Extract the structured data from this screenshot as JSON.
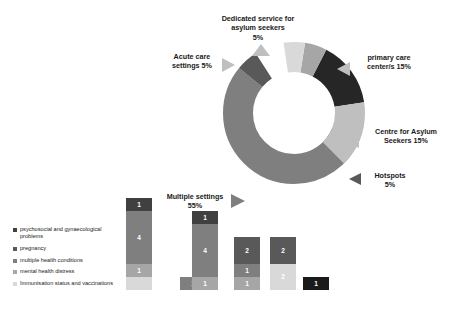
{
  "chart_data": [
    {
      "type": "pie",
      "title": "",
      "subtype": "donut",
      "legend_position": "callouts",
      "categories": [
        "Multiple settings",
        "primary care center/s",
        "Centre for Asylum Seekers",
        "Hotspots",
        "Dedicated service for asylum seekers",
        "Acute care settings"
      ],
      "values": [
        55,
        15,
        15,
        5,
        5,
        5
      ],
      "unit": "%",
      "labels": [
        {
          "name": "Dedicated service for asylum seekers",
          "value": "5%",
          "text": "Dedicated service for\nasylum seekers\n5%",
          "color": "#a6a6a6"
        },
        {
          "name": "Acute care settings",
          "value": "5%",
          "text": "Acute care\nsettings 5%",
          "color": "#d9d9d9"
        },
        {
          "name": "primary care center/s",
          "value": "15%",
          "text": "primary care\ncenter/s 15%",
          "color": "#262626"
        },
        {
          "name": "Centre for Asylum Seekers",
          "value": "15%",
          "text": "Centre for Asylum\nSeekers 15%",
          "color": "#bfbfbf"
        },
        {
          "name": "Hotspots",
          "value": "5%",
          "text": "Hotspots\n5%",
          "color": "#595959"
        },
        {
          "name": "Multiple settings",
          "value": "55%",
          "text": "Multiple settings\n55%",
          "color": "#7f7f7f"
        }
      ]
    },
    {
      "type": "bar",
      "subtype": "stacked",
      "title": "",
      "xlabel": "",
      "ylabel": "",
      "categories": [
        "Asylum seekers",
        "Displaced children",
        "Migrants",
        "Newly-arrived migrants",
        "Refugee",
        "Undocumented women"
      ],
      "series": [
        {
          "name": "psychosocial and gynaecological problems",
          "color": "#404040",
          "values": [
            1,
            0,
            1,
            2,
            2,
            1
          ]
        },
        {
          "name": "pregnancy",
          "color": "#595959",
          "values": [
            0,
            0,
            0,
            0,
            0,
            0
          ]
        },
        {
          "name": "multiple health conditions",
          "color": "#7f7f7f",
          "values": [
            4,
            1,
            4,
            1,
            0,
            0
          ]
        },
        {
          "name": "mental health distress",
          "color": "#a6a6a6",
          "values": [
            1,
            0,
            1,
            1,
            0,
            0
          ]
        },
        {
          "name": "Immunisation status and vaccinations",
          "color": "#d9d9d9",
          "values": [
            1,
            0,
            0,
            0,
            2,
            0
          ]
        }
      ],
      "bars": [
        {
          "category": "Asylum seekers",
          "label": "Asylum\nseekers",
          "segments": [
            {
              "value": 1,
              "color": "#d9d9d9",
              "show_label": false
            },
            {
              "value": 1,
              "color": "#a6a6a6",
              "show_label": true
            },
            {
              "value": 4,
              "color": "#7f7f7f",
              "show_label": true
            },
            {
              "value": 1,
              "color": "#404040",
              "show_label": true
            }
          ]
        },
        {
          "category": "Displaced children",
          "label": "Displaced\nchildren",
          "segments": [
            {
              "value": 1,
              "color": "#7f7f7f",
              "show_label": true
            }
          ]
        },
        {
          "category": "Migrants",
          "label": "Migrants",
          "segments": [
            {
              "value": 1,
              "color": "#a6a6a6",
              "show_label": true
            },
            {
              "value": 4,
              "color": "#7f7f7f",
              "show_label": true
            },
            {
              "value": 1,
              "color": "#404040",
              "show_label": true
            }
          ]
        },
        {
          "category": "Newly-arrived migrants",
          "label": "Newly-arrived\nmigrants",
          "segments": [
            {
              "value": 1,
              "color": "#a6a6a6",
              "show_label": true
            },
            {
              "value": 1,
              "color": "#7f7f7f",
              "show_label": true
            },
            {
              "value": 2,
              "color": "#595959",
              "show_label": true
            }
          ]
        },
        {
          "category": "Refugee",
          "label": "Refugee",
          "segments": [
            {
              "value": 2,
              "color": "#d9d9d9",
              "show_label": true
            },
            {
              "value": 2,
              "color": "#595959",
              "show_label": true
            }
          ]
        },
        {
          "category": "Undocumented women",
          "label": "Undocumented\nwomen",
          "segments": [
            {
              "value": 1,
              "color": "#1a1a1a",
              "show_label": true
            }
          ]
        }
      ]
    }
  ],
  "legend": {
    "items": [
      {
        "label": "psychosocial and gynaecological problems",
        "color": "#404040"
      },
      {
        "label": "pregnancy",
        "color": "#595959"
      },
      {
        "label": "multiple health conditions",
        "color": "#7f7f7f"
      },
      {
        "label": "mental health distress",
        "color": "#a6a6a6"
      },
      {
        "label": "Immunisation status and vaccinations",
        "color": "#d9d9d9"
      }
    ]
  }
}
